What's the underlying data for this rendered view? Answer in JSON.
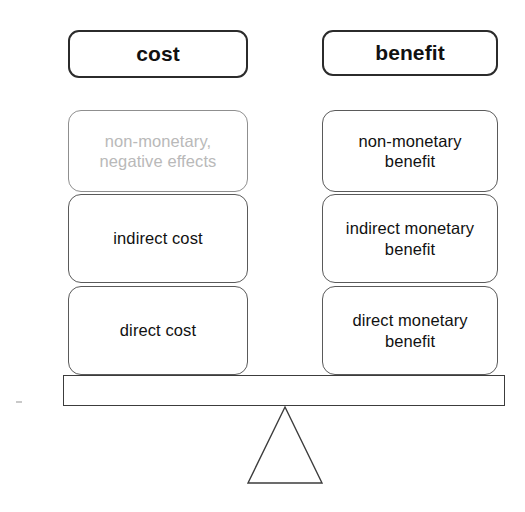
{
  "diagram": {
    "columns": [
      {
        "key": "cost",
        "header": "cost",
        "items": [
          {
            "label": "non-monetary,\nnegative effects",
            "style": "faded"
          },
          {
            "label": "indirect cost",
            "style": "normal"
          },
          {
            "label": "direct cost",
            "style": "normal"
          }
        ]
      },
      {
        "key": "benefit",
        "header": "benefit",
        "items": [
          {
            "label": "non-monetary\nbenefit",
            "style": "normal"
          },
          {
            "label": "indirect monetary\nbenefit",
            "style": "normal"
          },
          {
            "label": "direct monetary\nbenefit",
            "style": "normal"
          }
        ]
      }
    ],
    "beam": {
      "name": "balance-beam"
    },
    "fulcrum": {
      "name": "triangular-fulcrum"
    },
    "colors": {
      "box_border": "#5a5a5a",
      "header_border": "#2b2b2b",
      "faded_text": "#b9b9b9",
      "text": "#111111",
      "background": "#ffffff"
    }
  }
}
